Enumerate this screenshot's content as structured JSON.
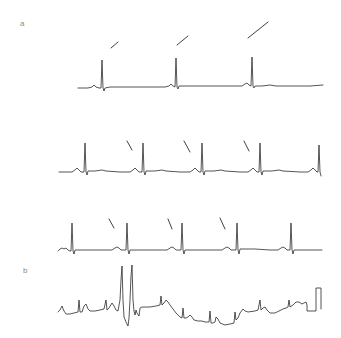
{
  "figure": {
    "panels": [
      {
        "label": "a",
        "label_pos": [
          20,
          20
        ],
        "traces": [
          {
            "name": "strip-1",
            "qrs_x": [
              102,
              176,
              252
            ],
            "points": "78,88 88,88 92,87 94,85 96,87 99,88 101,88 102,60 103,88 104,91 105,88 110,87 130,87 150,87 165,87 169,86 171,84 173,86 175,87 176,58 177,87 178,89 179,86 190,86 210,86 230,86 242,86 245,84 247,83 249,85 251,86 252,57 253,86 254,88 255,86 262,86 270,85 276,86 290,86 310,86 323,85",
            "markers": [
              {
                "x1": 111,
                "y1": 48,
                "x2": 118,
                "y2": 42
              },
              {
                "x1": 177,
                "y1": 45,
                "x2": 188,
                "y2": 36
              },
              {
                "x1": 248,
                "y1": 38,
                "x2": 268,
                "y2": 22
              }
            ]
          },
          {
            "name": "strip-2",
            "qrs_x": [
              85,
              143,
              202,
              260,
              319
            ],
            "points": "59,172 72,172 75,170 77,168 79,170 81,172 84,172 85,143 86,172 87,175 88,171 95,171 102,170 106,171 120,172 130,172 133,170 135,168 137,170 139,172 142,172 143,143 144,172 145,175 146,171 155,171 162,170 166,171 180,172 190,172 193,170 195,168 197,170 199,172 201,172 202,143 203,172 204,175 205,171 214,171 221,170 225,171 240,172 248,172 251,170 253,168 255,170 257,172 259,172 260,143 261,172 262,175 263,171 272,171 279,170 283,171 300,172 308,172 311,170 313,168 315,170 317,172 318,172 319,145 320,172 321,176",
            "markers": [
              {
                "x1": 127,
                "y1": 141,
                "x2": 132,
                "y2": 150
              },
              {
                "x1": 184,
                "y1": 141,
                "x2": 190,
                "y2": 152
              },
              {
                "x1": 244,
                "y1": 141,
                "x2": 249,
                "y2": 151
              }
            ]
          },
          {
            "name": "strip-3",
            "qrs_x": [
              72,
              127,
              182,
              237,
              291
            ],
            "points": "58,251 60,249 62,248 64,249 66,248 68,250 70,251 71,251 72,223 73,251 74,254 75,250 85,250 100,250 112,250 115,248 117,247 119,248 121,250 126,250 127,223 128,250 129,254 130,250 140,250 160,250 167,250 170,248 172,247 174,248 176,250 181,250 182,223 183,250 184,254 185,250 195,250 210,250 222,250 225,248 227,247 229,248 231,250 236,250 237,223 238,250 239,254 240,249 255,249 270,250 278,250 281,248 283,247 285,248 287,250 290,250 291,223 292,250 293,254 294,250 305,250 322,250",
            "markers": [
              {
                "x1": 109,
                "y1": 219,
                "x2": 114,
                "y2": 228
              },
              {
                "x1": 168,
                "y1": 219,
                "x2": 172,
                "y2": 229
              },
              {
                "x1": 220,
                "y1": 218,
                "x2": 225,
                "y2": 229
              }
            ]
          }
        ]
      },
      {
        "label": "b",
        "label_pos": [
          23,
          267
        ],
        "traces": [
          {
            "name": "arrhythmia-strip",
            "points": "58,312 60,310 62,306 64,311 66,314 70,314 74,313 78,312 79,300 80,312 82,312 84,306 86,304 88,309 90,311 95,311 100,310 104,309 106,300 107,310 109,308 112,303 114,306 116,310 118,311 120,300 121,280 122,266 123,300 124,317 126,322 128,326 129,318 130,300 131,276 132,265 133,300 134,311 135,315 136,310 137,313 139,316 140,308 142,307 150,307 156,306 160,305 161,296 162,305 164,303 166,300 168,302 170,305 173,309 176,313 180,317 182,318 183,308 184,318 186,318 188,317 190,315 192,317 194,320 198,321 202,321 205,322 209,322 210,311 211,323 213,323 215,322 216,317 218,319 220,323 225,325 230,324 234,323 235,312 236,320 238,318 240,313 243,309 245,311 248,312 255,311 258,310 260,300 261,310 263,308 265,307 267,310 270,313 275,313 283,309 286,308 288,307 289,300 290,307 293,305 296,302 299,302 302,304 306,302 307,305 307,311 316,311 316,288 321,288 321,309"
          }
        ]
      }
    ]
  }
}
